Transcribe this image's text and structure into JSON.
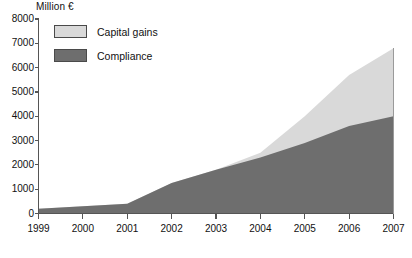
{
  "chart_data": {
    "type": "area",
    "stacked": true,
    "title": "",
    "subtitle": "",
    "unit_label": "Million €",
    "xlabel": "",
    "ylabel": "",
    "categories": [
      "1999",
      "2000",
      "2001",
      "2002",
      "2003",
      "2004",
      "2005",
      "2006",
      "2007"
    ],
    "x": [
      1999,
      2000,
      2001,
      2002,
      2003,
      2004,
      2005,
      2006,
      2007
    ],
    "series": [
      {
        "name": "Compliance",
        "color": "#6e6e6e",
        "values": [
          200,
          300,
          400,
          1250,
          1800,
          2300,
          2900,
          3600,
          4000
        ]
      },
      {
        "name": "Capital gains",
        "color": "#d9d9d9",
        "values": [
          0,
          0,
          0,
          0,
          0,
          200,
          1100,
          2100,
          2800
        ]
      }
    ],
    "cumulative_totals": [
      200,
      300,
      400,
      1250,
      1800,
      2500,
      4000,
      5700,
      6800
    ],
    "ylim": [
      0,
      8000
    ],
    "xlim": [
      1999,
      2007
    ],
    "yticks": [
      0,
      1000,
      2000,
      3000,
      4000,
      5000,
      6000,
      7000,
      8000
    ],
    "ytick_labels": [
      "0",
      "1000",
      "2000",
      "3000",
      "4000",
      "5000",
      "6000",
      "7000",
      "8000"
    ],
    "xtick_labels": [
      "1999",
      "2000",
      "2001",
      "2002",
      "2003",
      "2004",
      "2005",
      "2006",
      "2007"
    ],
    "grid": false,
    "legend_position": "top-left",
    "legend": [
      {
        "label": "Capital gains",
        "color": "#d9d9d9"
      },
      {
        "label": "Compliance",
        "color": "#6e6e6e"
      }
    ]
  },
  "colors": {
    "capital_gains": "#d9d9d9",
    "compliance": "#6e6e6e",
    "axis": "#555555",
    "text": "#111111",
    "background": "#ffffff"
  }
}
